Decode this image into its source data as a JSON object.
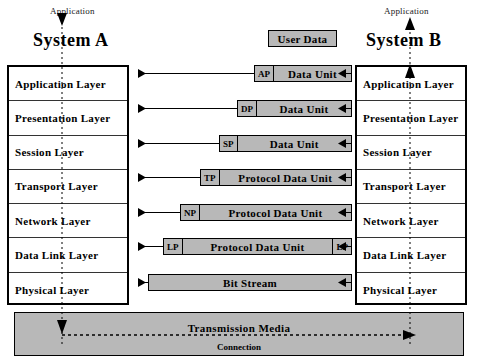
{
  "diagram": {
    "colors": {
      "box_fill": "#b8b8b8",
      "stroke": "#000000",
      "background": "#ffffff"
    }
  },
  "systems": {
    "left": {
      "name": "System A",
      "application_label": "Application",
      "arrow_direction": "down"
    },
    "right": {
      "name": "System B",
      "application_label": "Application",
      "arrow_direction": "up"
    }
  },
  "layers": [
    {
      "name": "Application Layer"
    },
    {
      "name": "Presentation Layer"
    },
    {
      "name": "Session  Layer"
    },
    {
      "name": "Transport  Layer"
    },
    {
      "name": "Network  Layer"
    },
    {
      "name": "Data  Link  Layer"
    },
    {
      "name": "Physical Layer"
    }
  ],
  "user_data": {
    "label": "User Data"
  },
  "pdus": [
    {
      "header": "AP",
      "body": "Data Unit",
      "trailer": ""
    },
    {
      "header": "DP",
      "body": "Data Unit",
      "trailer": ""
    },
    {
      "header": "SP",
      "body": "Data Unit",
      "trailer": ""
    },
    {
      "header": "TP",
      "body": "Protocol Data Unit",
      "trailer": ""
    },
    {
      "header": "NP",
      "body": "Protocol Data Unit",
      "trailer": ""
    },
    {
      "header": "LP",
      "body": "Protocol Data Unit",
      "trailer": "LP"
    },
    {
      "header": "",
      "body": "Bit  Stream",
      "trailer": ""
    }
  ],
  "media": {
    "title": "Transmission   Media",
    "subtitle": "Connection"
  }
}
